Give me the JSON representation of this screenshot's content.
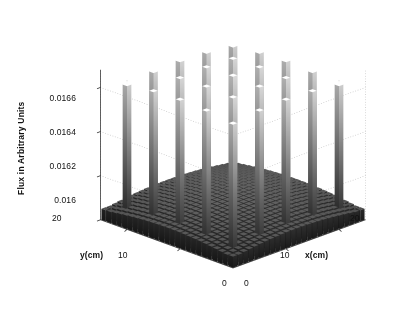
{
  "figure": {
    "background_color": "#ffffff",
    "axis_line_color": "#3a3a3a",
    "grid_color": "#b8b8b8",
    "text_color": "#111111"
  },
  "chart_data": {
    "type": "bar",
    "subtype": "bar3-surface",
    "title": "",
    "xlabel": "x(cm)",
    "ylabel": "y(cm)",
    "zlabel": "Flux in Arbitrary Units",
    "grid": true,
    "legend": null,
    "x_ticks": [
      "0",
      "10",
      "20"
    ],
    "x_tick_values": [
      0,
      10,
      20
    ],
    "y_ticks": [
      "0",
      "10",
      "20"
    ],
    "y_tick_values": [
      0,
      10,
      20
    ],
    "z_ticks": [
      "0.016",
      "0.0162",
      "0.0164",
      "0.0166"
    ],
    "z_tick_values": [
      0.016,
      0.0162,
      0.0164,
      0.0166
    ],
    "xlim": [
      0,
      25
    ],
    "ylim": [
      0,
      25
    ],
    "zlim": [
      0.016,
      0.01668
    ],
    "grid_nx": 25,
    "grid_ny": 25,
    "baseline_value": 0.01605,
    "peak_value": 0.016655,
    "peak_lattice": {
      "count_x": 5,
      "count_y": 5,
      "start_index_x": 2,
      "start_index_y": 2,
      "spacing": 5
    },
    "colormap": "gray"
  },
  "labels": {
    "z_title": "Flux in Arbitrary Units",
    "x_title": "x(cm)",
    "y_title": "y(cm)",
    "origin_x": "0",
    "origin_y": "0",
    "z_tick_0": "0.016",
    "z_tick_1": "0.0162",
    "z_tick_2": "0.0164",
    "z_tick_3": "0.0166",
    "x_tick_10": "10",
    "x_tick_20": "20",
    "y_tick_10": "10",
    "y_tick_20": "20"
  }
}
